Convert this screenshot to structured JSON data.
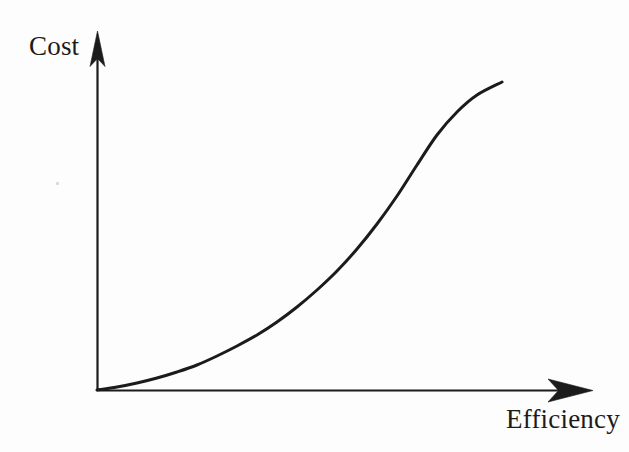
{
  "figure": {
    "kind": "hand-drawn-line-chart",
    "background_color": "#fdfdfd",
    "ink_color": "#1b1b1b",
    "width": 629,
    "height": 452
  },
  "axes": {
    "y": {
      "label": "Cost",
      "label_position": "top-left",
      "arrow": "up-arrow-icon",
      "origin_px": [
        97,
        390
      ],
      "tip_px": [
        97,
        33
      ],
      "ticks": [],
      "tick_labels": []
    },
    "x": {
      "label": "Efficiency",
      "label_position": "bottom-right",
      "arrow": "right-arrow-icon",
      "origin_px": [
        97,
        390
      ],
      "tip_px": [
        592,
        390
      ],
      "ticks": [],
      "tick_labels": []
    }
  },
  "chart_data": {
    "type": "line",
    "title": "",
    "subtitle": "",
    "xlabel": "Efficiency",
    "ylabel": "Cost",
    "xlim": [
      0,
      1
    ],
    "ylim": [
      0,
      1
    ],
    "grid": false,
    "legend": null,
    "legend_position": "none",
    "annotations": [],
    "series": [
      {
        "name": "Cost vs Efficiency",
        "color": "#1b1b1b",
        "linewidth": 3,
        "shape": "convex-increasing",
        "description": "Cost rises slowly at first then increases steeply as efficiency approaches its maximum",
        "x": [
          0.0,
          0.05,
          0.1,
          0.15,
          0.2,
          0.25,
          0.3,
          0.35,
          0.4,
          0.45,
          0.5,
          0.55,
          0.6,
          0.65,
          0.7,
          0.75,
          0.8,
          0.85,
          0.9,
          0.95,
          1.0
        ],
        "y": [
          0.0,
          0.008,
          0.019,
          0.033,
          0.05,
          0.07,
          0.094,
          0.122,
          0.154,
          0.191,
          0.233,
          0.281,
          0.336,
          0.398,
          0.468,
          0.548,
          0.638,
          0.74,
          0.855,
          0.92,
          0.975
        ]
      }
    ],
    "points_px": [
      [
        97,
        390
      ],
      [
        117,
        387
      ],
      [
        137,
        383
      ],
      [
        157,
        378
      ],
      [
        177,
        372
      ],
      [
        197,
        365
      ],
      [
        217,
        356
      ],
      [
        237,
        346
      ],
      [
        257,
        335
      ],
      [
        277,
        322
      ],
      [
        297,
        307
      ],
      [
        317,
        290
      ],
      [
        337,
        271
      ],
      [
        357,
        249
      ],
      [
        377,
        224
      ],
      [
        397,
        196
      ],
      [
        417,
        165
      ],
      [
        437,
        135
      ],
      [
        457,
        112
      ],
      [
        477,
        95
      ],
      [
        502,
        82
      ]
    ]
  },
  "marks": {
    "speck": {
      "name": "dust-speck",
      "color": "#d8d8d8"
    }
  }
}
